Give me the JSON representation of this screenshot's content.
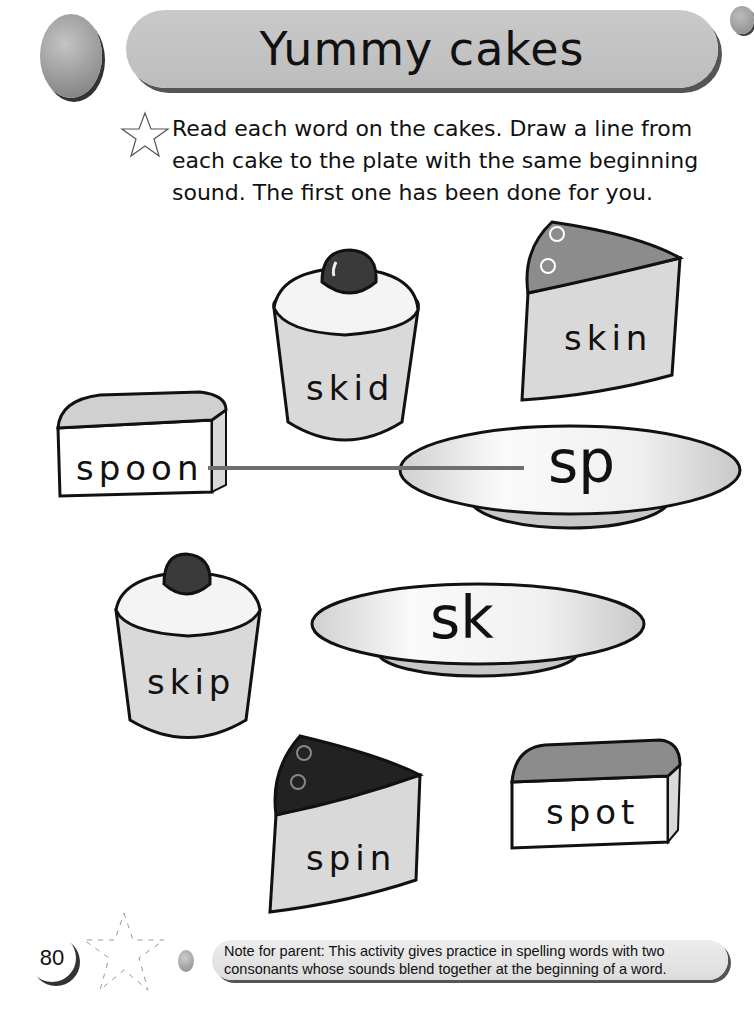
{
  "header": {
    "title": "Yummy cakes"
  },
  "instructions": {
    "icon": "star-outline-icon",
    "text": "Read each word on the cakes. Draw a line from each cake to the plate with the same beginning sound. The first one has been done for you."
  },
  "cakes": [
    {
      "word": "skid",
      "type": "cupcake"
    },
    {
      "word": "skin",
      "type": "cake-slice-swirl"
    },
    {
      "word": "spoon",
      "type": "cake-block"
    },
    {
      "word": "skip",
      "type": "cupcake"
    },
    {
      "word": "spin",
      "type": "cake-slice-dark"
    },
    {
      "word": "spot",
      "type": "cake-block"
    }
  ],
  "plates": [
    {
      "label": "sp"
    },
    {
      "label": "sk"
    }
  ],
  "example_line": {
    "from": "spoon",
    "to": "sp",
    "color": "#6e6e6e"
  },
  "footer": {
    "page_number": "80",
    "note": "Note for parent: This activity gives practice in spelling words with two consonants whose sounds blend together at the beginning of a word."
  },
  "colors": {
    "title_bar": "#c4c4c4",
    "cake_body": "#d9d9d9",
    "cherry": "#3a3a3a",
    "slice_top_light": "#8c8c8c",
    "slice_top_dark": "#222222",
    "line": "#6e6e6e"
  }
}
